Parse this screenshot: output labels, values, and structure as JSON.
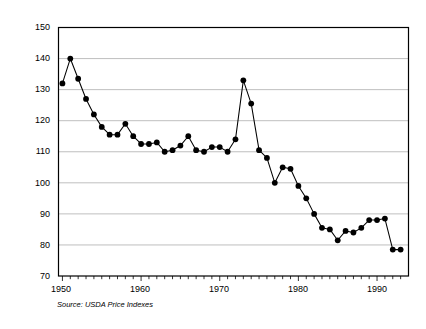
{
  "chart_data": {
    "type": "line",
    "title": "",
    "xlabel": "",
    "ylabel": "Output/Input Price Ratio",
    "xlim": [
      1949.5,
      1994
    ],
    "ylim": [
      70,
      150
    ],
    "ytick_values": [
      70,
      80,
      90,
      100,
      110,
      120,
      130,
      140,
      150
    ],
    "xtick_labels": [
      "1950",
      "1960",
      "1970",
      "1980",
      "1990"
    ],
    "xtick_label_values": [
      1950,
      1960,
      1970,
      1980,
      1990
    ],
    "minor_xticks_every": 1,
    "grid": "horizontal",
    "legend": "none",
    "marker": "filled-circle",
    "annotation": "Source: USDA Price Indexes",
    "x": [
      1950,
      1951,
      1952,
      1953,
      1954,
      1955,
      1956,
      1957,
      1958,
      1959,
      1960,
      1961,
      1962,
      1963,
      1964,
      1965,
      1966,
      1967,
      1968,
      1969,
      1970,
      1971,
      1972,
      1973,
      1974,
      1975,
      1976,
      1977,
      1978,
      1979,
      1980,
      1981,
      1982,
      1983,
      1984,
      1985,
      1986,
      1987,
      1988,
      1989,
      1990,
      1991,
      1992,
      1993
    ],
    "values": [
      132,
      140,
      133.5,
      127,
      122,
      118,
      115.5,
      115.5,
      119,
      115,
      112.5,
      112.5,
      113,
      110,
      110.5,
      112,
      115,
      110.5,
      110,
      111.5,
      111.5,
      110,
      114,
      133,
      125.5,
      110.5,
      108,
      100,
      105,
      104.5,
      99,
      95,
      90,
      85.5,
      85,
      81.5,
      84.5,
      84,
      85.5,
      88,
      88,
      88.5,
      78.5,
      78.5
    ]
  },
  "axis": {
    "ylabel": "Output/Input Price Ratio",
    "yticks": [
      "150",
      "140",
      "130",
      "120",
      "110",
      "100",
      "90",
      "80",
      "70"
    ],
    "xticks": [
      "1950",
      "1960",
      "1970",
      "1980",
      "1990"
    ]
  },
  "footnote": {
    "source": "Source: USDA Price Indexes"
  },
  "colors": {
    "line": "#000000",
    "marker": "#000000",
    "grid": "#b8b8b8",
    "frame": "#000000",
    "background": "#ffffff"
  }
}
